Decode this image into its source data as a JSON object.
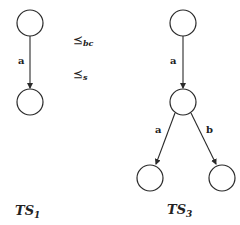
{
  "diagram": {
    "ts1": {
      "title": "TS",
      "title_sub": "1",
      "nodes": [
        {
          "id": "s0",
          "cx": 30,
          "cy": 23,
          "r": 13
        },
        {
          "id": "s1",
          "cx": 30,
          "cy": 102,
          "r": 13
        }
      ],
      "edges": [
        {
          "from": "s0",
          "to": "s1",
          "label": "a"
        }
      ]
    },
    "relations": [
      {
        "symbol": "⪯",
        "subscript": "bc"
      },
      {
        "symbol": "⪯",
        "subscript": "s"
      }
    ],
    "ts3": {
      "title": "TS",
      "title_sub": "3",
      "nodes": [
        {
          "id": "t0",
          "cx": 183,
          "cy": 23,
          "r": 13
        },
        {
          "id": "t1",
          "cx": 183,
          "cy": 102,
          "r": 13
        },
        {
          "id": "t2",
          "cx": 150,
          "cy": 178,
          "r": 13
        },
        {
          "id": "t3",
          "cx": 222,
          "cy": 178,
          "r": 13
        }
      ],
      "edges": [
        {
          "from": "t0",
          "to": "t1",
          "label": "a"
        },
        {
          "from": "t1",
          "to": "t2",
          "label": "a"
        },
        {
          "from": "t1",
          "to": "t3",
          "label": "b"
        }
      ]
    }
  }
}
